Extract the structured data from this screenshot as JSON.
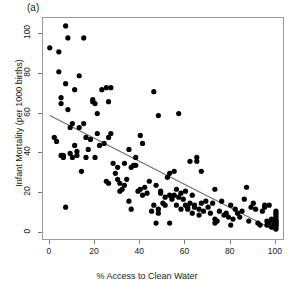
{
  "chart_data": {
    "type": "scatter",
    "title": "",
    "panel_label": "(a)",
    "xlabel": "% Access to Clean Water",
    "ylabel": "Infant Mortality (per 1000 births)",
    "xlim": [
      -3,
      104
    ],
    "ylim": [
      -4,
      108
    ],
    "xticks": [
      0,
      20,
      40,
      60,
      80,
      100
    ],
    "yticks": [
      0,
      20,
      40,
      60,
      80,
      100
    ],
    "xtick_labels": [
      "0",
      "20",
      "40",
      "60",
      "80",
      "100"
    ],
    "ytick_labels": [
      "0",
      "20",
      "40",
      "60",
      "80",
      "100"
    ],
    "grid": false,
    "legend": null,
    "point_color": "#000000",
    "point_size": 2.6,
    "frame_color": "#9a9a9a",
    "series": [
      {
        "name": "countries",
        "points": [
          [
            0,
            93
          ],
          [
            2,
            48
          ],
          [
            3,
            46
          ],
          [
            4,
            81
          ],
          [
            4,
            91
          ],
          [
            5,
            65
          ],
          [
            5,
            68
          ],
          [
            5,
            39
          ],
          [
            6,
            38
          ],
          [
            6,
            39
          ],
          [
            7,
            104
          ],
          [
            7,
            75
          ],
          [
            7,
            13
          ],
          [
            8,
            98
          ],
          [
            8,
            62
          ],
          [
            9,
            53
          ],
          [
            9,
            40
          ],
          [
            10,
            55
          ],
          [
            10,
            38
          ],
          [
            11,
            72
          ],
          [
            11,
            44
          ],
          [
            12,
            41
          ],
          [
            12,
            39
          ],
          [
            13,
            79
          ],
          [
            13,
            53
          ],
          [
            14,
            31
          ],
          [
            15,
            98
          ],
          [
            15,
            55
          ],
          [
            16,
            38
          ],
          [
            16,
            48
          ],
          [
            17,
            42
          ],
          [
            18,
            47
          ],
          [
            19,
            66
          ],
          [
            19,
            67
          ],
          [
            20,
            65
          ],
          [
            20,
            38
          ],
          [
            21,
            60
          ],
          [
            21,
            50
          ],
          [
            22,
            44
          ],
          [
            23,
            72
          ],
          [
            24,
            45
          ],
          [
            25,
            73
          ],
          [
            25,
            26
          ],
          [
            26,
            66
          ],
          [
            26,
            25
          ],
          [
            26,
            48
          ],
          [
            27,
            73
          ],
          [
            27,
            50
          ],
          [
            28,
            35
          ],
          [
            29,
            30
          ],
          [
            30,
            33
          ],
          [
            30,
            27
          ],
          [
            31,
            25
          ],
          [
            31,
            21
          ],
          [
            32,
            22
          ],
          [
            33,
            24
          ],
          [
            33,
            35
          ],
          [
            34,
            27
          ],
          [
            35,
            42
          ],
          [
            35,
            16
          ],
          [
            36,
            33
          ],
          [
            36,
            12
          ],
          [
            37,
            34
          ],
          [
            38,
            38
          ],
          [
            38,
            34
          ],
          [
            39,
            21
          ],
          [
            40,
            22
          ],
          [
            40,
            49
          ],
          [
            41,
            45
          ],
          [
            41,
            19
          ],
          [
            42,
            23
          ],
          [
            43,
            20
          ],
          [
            44,
            26
          ],
          [
            45,
            11
          ],
          [
            46,
            71
          ],
          [
            46,
            14
          ],
          [
            47,
            24
          ],
          [
            47,
            5
          ],
          [
            48,
            59
          ],
          [
            48,
            12
          ],
          [
            48,
            10
          ],
          [
            49,
            21
          ],
          [
            49,
            20
          ],
          [
            50,
            15
          ],
          [
            51,
            18
          ],
          [
            51,
            14
          ],
          [
            52,
            28
          ],
          [
            53,
            5
          ],
          [
            53,
            30
          ],
          [
            53,
            19
          ],
          [
            54,
            18
          ],
          [
            54,
            17
          ],
          [
            55,
            31
          ],
          [
            55,
            19
          ],
          [
            56,
            22
          ],
          [
            56,
            14
          ],
          [
            57,
            60
          ],
          [
            57,
            18
          ],
          [
            58,
            20
          ],
          [
            58,
            12
          ],
          [
            59,
            17
          ],
          [
            60,
            21
          ],
          [
            60,
            14
          ],
          [
            61,
            13
          ],
          [
            61,
            12
          ],
          [
            62,
            36
          ],
          [
            62,
            15
          ],
          [
            63,
            10
          ],
          [
            63,
            19
          ],
          [
            64,
            14
          ],
          [
            64,
            13
          ],
          [
            65,
            38
          ],
          [
            65,
            36
          ],
          [
            66,
            12
          ],
          [
            66,
            9
          ],
          [
            67,
            31
          ],
          [
            67,
            15
          ],
          [
            68,
            11
          ],
          [
            69,
            16
          ],
          [
            70,
            13
          ],
          [
            71,
            10
          ],
          [
            72,
            15
          ],
          [
            73,
            5
          ],
          [
            73,
            22
          ],
          [
            73,
            7
          ],
          [
            74,
            6
          ],
          [
            75,
            11
          ],
          [
            76,
            16
          ],
          [
            77,
            9
          ],
          [
            78,
            10
          ],
          [
            79,
            8
          ],
          [
            80,
            4
          ],
          [
            80,
            14
          ],
          [
            81,
            7
          ],
          [
            82,
            12
          ],
          [
            83,
            10
          ],
          [
            84,
            8
          ],
          [
            85,
            11
          ],
          [
            86,
            17
          ],
          [
            87,
            23
          ],
          [
            88,
            6
          ],
          [
            89,
            13
          ],
          [
            90,
            15
          ],
          [
            91,
            12
          ],
          [
            92,
            5
          ],
          [
            93,
            4
          ],
          [
            94,
            11
          ],
          [
            95,
            14
          ],
          [
            95,
            13
          ],
          [
            96,
            6
          ],
          [
            96,
            4
          ],
          [
            97,
            5
          ],
          [
            97,
            14
          ],
          [
            98,
            3
          ],
          [
            98,
            7
          ],
          [
            99,
            4
          ],
          [
            99,
            6
          ],
          [
            100,
            2
          ],
          [
            100,
            3
          ],
          [
            100,
            4
          ],
          [
            100,
            5
          ],
          [
            100,
            6
          ],
          [
            100,
            7
          ],
          [
            100,
            8
          ],
          [
            100,
            9
          ],
          [
            100,
            10
          ],
          [
            100,
            11
          ],
          [
            100,
            5
          ],
          [
            100,
            4
          ],
          [
            100,
            6
          ]
        ]
      }
    ],
    "fit_line": {
      "type": "linear-regression",
      "color": "#6e6e6e",
      "x_start": 0,
      "y_start": 59,
      "x_end": 100,
      "y_end": 1
    }
  }
}
